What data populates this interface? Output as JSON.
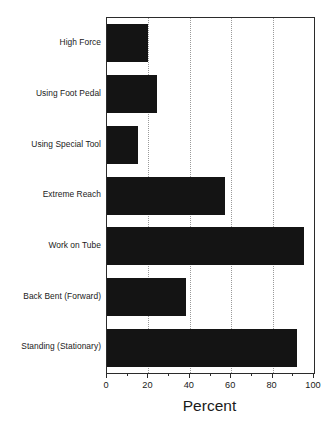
{
  "chart_data": {
    "type": "bar",
    "orientation": "horizontal",
    "title": "",
    "xlabel": "Percent",
    "ylabel": "",
    "categories": [
      "High Force",
      "Using Foot Pedal",
      "Using Special Tool",
      "Extreme Reach",
      "Work on Tube",
      "Back Bent (Forward)",
      "Standing (Stationary)"
    ],
    "values": [
      20,
      24,
      15,
      57,
      95,
      38,
      92
    ],
    "xlim": [
      0,
      100
    ],
    "xticks": [
      0,
      20,
      40,
      60,
      80,
      100
    ],
    "xtick_labels": [
      "0",
      "20",
      "40",
      "60",
      "80",
      "100"
    ],
    "xminor_ticks": [
      10,
      30,
      50,
      70,
      90
    ],
    "gridlines": [
      20,
      40,
      60,
      80
    ],
    "grid": "vertical-dotted",
    "legend": "none",
    "bar_color": "#141414",
    "axis_color": "#2b2b2b",
    "grid_color": "#9a9a9a",
    "background": "#ffffff"
  }
}
